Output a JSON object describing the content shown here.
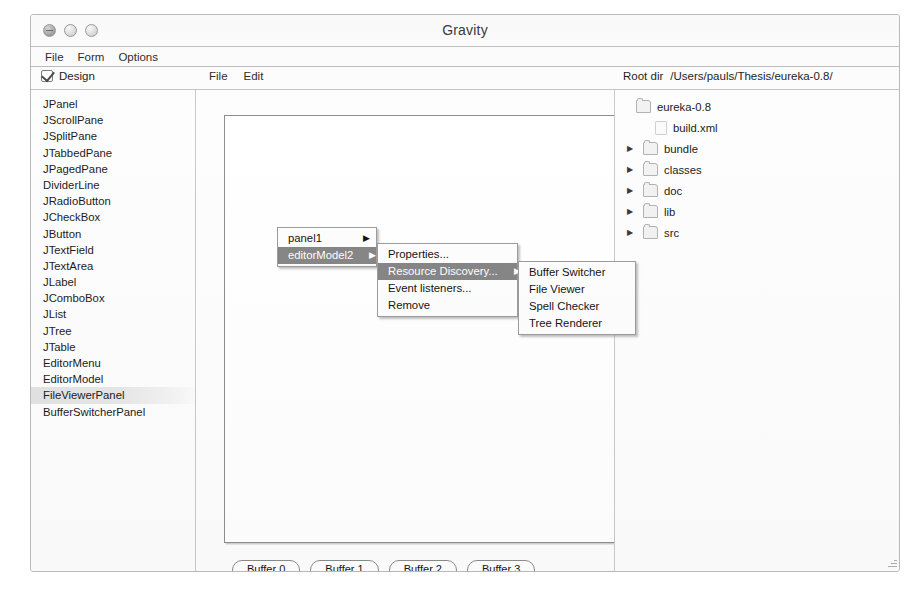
{
  "window": {
    "title": "Gravity",
    "controls": [
      "close-button",
      "minimize-button",
      "zoom-button"
    ]
  },
  "menubar": {
    "items": [
      {
        "label": "File"
      },
      {
        "label": "Form"
      },
      {
        "label": "Options"
      }
    ]
  },
  "toolstrip": {
    "design_toggle": {
      "label": "Design",
      "checked": true
    },
    "canvas_menus": [
      {
        "label": "File"
      },
      {
        "label": "Edit"
      }
    ],
    "rootdir": {
      "label": "Root dir",
      "path": "/Users/pauls/Thesis/eureka-0.8/"
    }
  },
  "palette": {
    "selected": "FileViewerPanel",
    "items": [
      {
        "label": "JPanel"
      },
      {
        "label": "JScrollPane"
      },
      {
        "label": "JSplitPane"
      },
      {
        "label": "JTabbedPane"
      },
      {
        "label": "JPagedPane"
      },
      {
        "label": "DividerLine"
      },
      {
        "label": "JRadioButton"
      },
      {
        "label": "JCheckBox"
      },
      {
        "label": "JButton"
      },
      {
        "label": "JTextField"
      },
      {
        "label": "JTextArea"
      },
      {
        "label": "JLabel"
      },
      {
        "label": "JComboBox"
      },
      {
        "label": "JList"
      },
      {
        "label": "JTree"
      },
      {
        "label": "JTable"
      },
      {
        "label": "EditorMenu"
      },
      {
        "label": "EditorModel"
      },
      {
        "label": "FileViewerPanel"
      },
      {
        "label": "BufferSwitcherPanel"
      }
    ]
  },
  "designer": {
    "buffers": [
      {
        "label": "Buffer 0"
      },
      {
        "label": "Buffer 1"
      },
      {
        "label": "Buffer 2"
      },
      {
        "label": "Buffer 3"
      }
    ]
  },
  "context_menus": {
    "components": {
      "items": [
        {
          "label": "panel1",
          "submenu": true,
          "highlight": false
        },
        {
          "label": "editorModel2",
          "submenu": true,
          "highlight": true
        }
      ]
    },
    "actions": {
      "items": [
        {
          "label": "Properties...",
          "submenu": false,
          "highlight": false
        },
        {
          "label": "Resource Discovery...",
          "submenu": true,
          "highlight": true
        },
        {
          "label": "Event listeners...",
          "submenu": false,
          "highlight": false
        },
        {
          "label": "Remove",
          "submenu": false,
          "highlight": false
        }
      ]
    },
    "resources": {
      "items": [
        {
          "label": "Buffer Switcher",
          "submenu": false,
          "highlight": false
        },
        {
          "label": "File Viewer",
          "submenu": false,
          "highlight": false
        },
        {
          "label": "Spell Checker",
          "submenu": false,
          "highlight": false
        },
        {
          "label": "Tree Renderer",
          "submenu": false,
          "highlight": false
        }
      ]
    },
    "submenu_arrow": "▶"
  },
  "filetree": {
    "rows": [
      {
        "label": "eureka-0.8",
        "arrow": false,
        "icon": "folder-icon",
        "indent": 0
      },
      {
        "label": "build.xml",
        "arrow": false,
        "icon": "file-icon",
        "indent": 1
      },
      {
        "label": "bundle",
        "arrow": true,
        "icon": "folder-icon",
        "indent": 0
      },
      {
        "label": "classes",
        "arrow": true,
        "icon": "folder-icon",
        "indent": 0
      },
      {
        "label": "doc",
        "arrow": true,
        "icon": "folder-icon",
        "indent": 0
      },
      {
        "label": "lib",
        "arrow": true,
        "icon": "folder-icon",
        "indent": 0
      },
      {
        "label": "src",
        "arrow": true,
        "icon": "folder-icon",
        "indent": 0
      }
    ],
    "collapsed_arrow": "▶"
  },
  "colors": {
    "menu_highlight": "#868686",
    "menu_highlight_text": "#ffffff",
    "selection_band": "#e2e2e2",
    "window_border": "#b9b9b9",
    "canvas_border": "#8e8e8e"
  }
}
